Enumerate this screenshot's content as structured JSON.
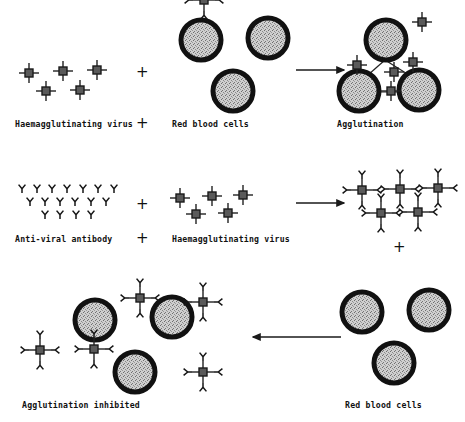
{
  "figure": {
    "title_semantic": "haemagglutination-inhibition-diagram",
    "background_color": "#ffffff",
    "ink_color": "#111111",
    "cell_ring_color": "#111111",
    "cell_fill_color": "#c9c9c9",
    "virus_body_color": "#4a4a4a"
  },
  "rows": [
    {
      "id": "row-1",
      "labels": {
        "reactant_a": "Haemagglutinating virus",
        "operator": "+",
        "reactant_b": "Red blood cells",
        "product": "Agglutination"
      },
      "arrow": "right"
    },
    {
      "id": "row-2",
      "labels": {
        "reactant_a": "Anti-viral antibody",
        "operator": "+",
        "reactant_b": "Haemagglutinating virus",
        "product_operator": "+"
      },
      "arrow": "right"
    },
    {
      "id": "row-3",
      "labels": {
        "product": "Agglutination inhibited",
        "reactant_b": "Red blood cells"
      },
      "arrow": "left"
    }
  ],
  "counts": {
    "row1_free_viruses": 5,
    "row1_red_blood_cells": 3,
    "row1_agglutinated_cells": 3,
    "row2_antibody_rows": [
      7,
      6,
      4
    ],
    "row2_free_viruses": 5,
    "row2_neutralised_complexes": 5,
    "row3_free_cells_left": 3,
    "row3_antibody_virus_complexes": 5,
    "row3_red_blood_cells_right": 3
  }
}
